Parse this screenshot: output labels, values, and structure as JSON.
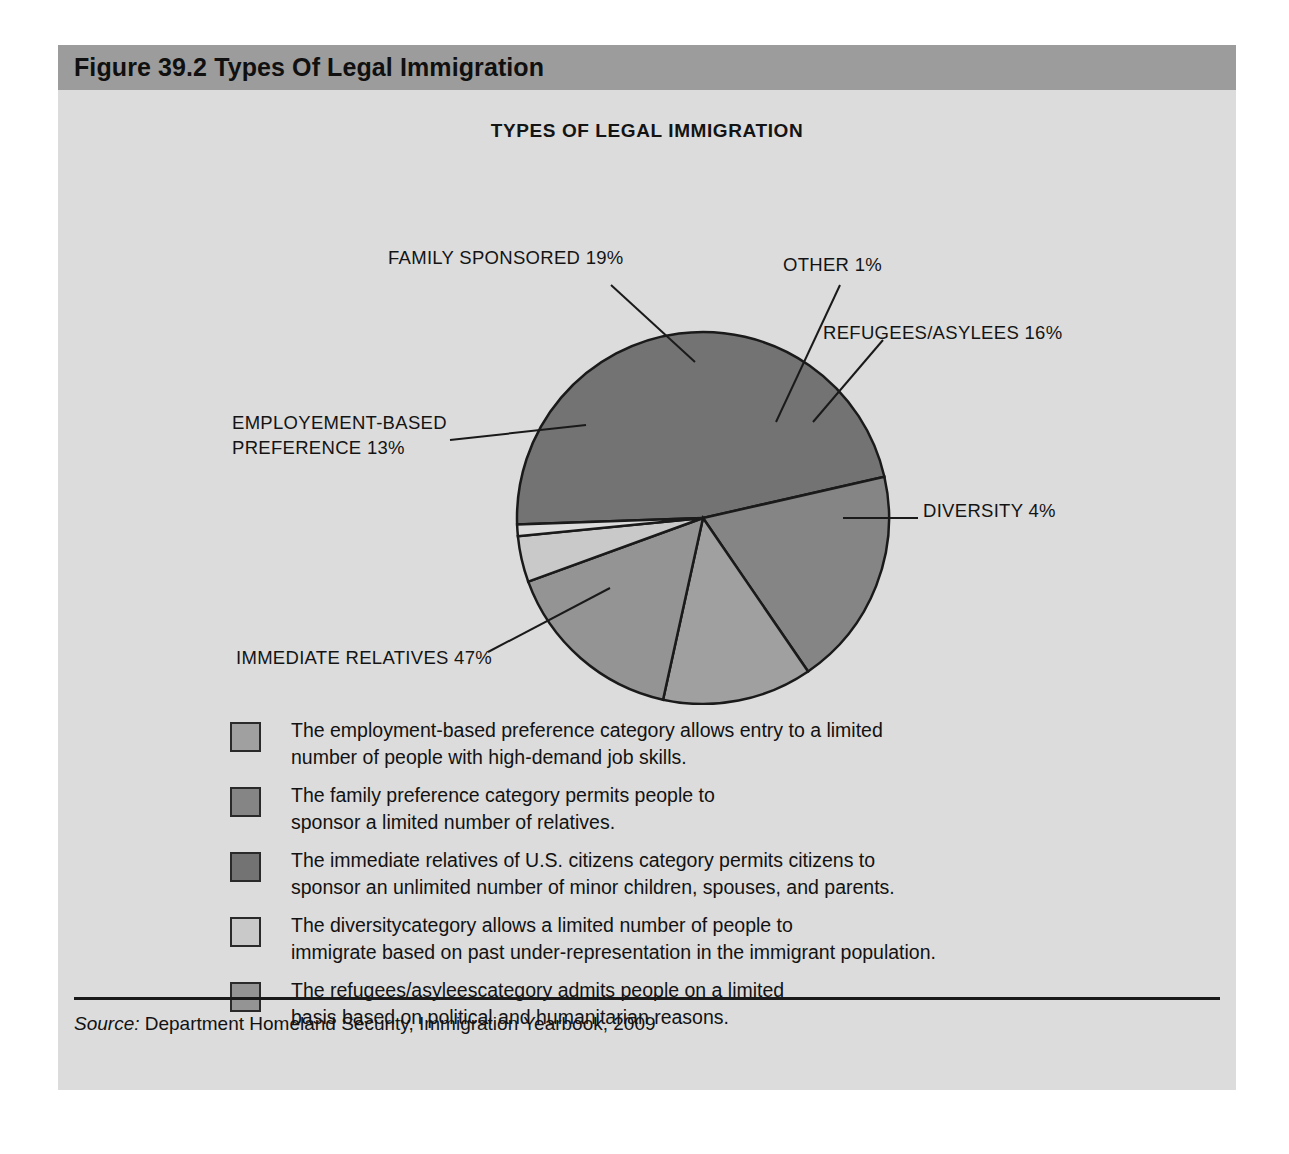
{
  "figure": {
    "header_title": "Figure 39.2  Types Of Legal Immigration",
    "chart_title": "TYPES OF LEGAL IMMIGRATION"
  },
  "source": {
    "label": "Source:",
    "text": " Department Homeland Security, Immigration Yearbook, 2009"
  },
  "colors": {
    "panel_background": "#dcdcdc",
    "header_bar": "#9c9c9c",
    "employment_based": "#a0a0a0",
    "family_sponsored": "#858585",
    "immediate_relatives": "#737373",
    "diversity": "#c9c9c9",
    "refugees_asylees": "#949494",
    "other": "#dcdcdc",
    "outline": "#1a1a1a",
    "text": "#121212"
  },
  "callouts": [
    {
      "key": "family_sponsored",
      "text": "FAMILY SPONSORED 19%"
    },
    {
      "key": "other",
      "text": "OTHER 1%"
    },
    {
      "key": "refugees_asylees",
      "text": "REFUGEES/ASYLEES 16%"
    },
    {
      "key": "employment_based",
      "line1": "EMPLOYEMENT-BASED",
      "line2": "PREFERENCE 13%"
    },
    {
      "key": "diversity",
      "text": "DIVERSITY 4%"
    },
    {
      "key": "immediate_relatives",
      "text": "IMMEDIATE RELATIVES 47%"
    }
  ],
  "legend": [
    {
      "swatch_color": "#a0a0a0",
      "text": "The employment-based preference category allows entry to a limited\nnumber of people with high-demand job skills."
    },
    {
      "swatch_color": "#858585",
      "text": "The family preference category permits people to\nsponsor a limited number of relatives."
    },
    {
      "swatch_color": "#737373",
      "text": "The immediate relatives of U.S. citizens category permits citizens to\nsponsor an unlimited number of minor children, spouses, and parents."
    },
    {
      "swatch_color": "#c9c9c9",
      "text": "The diversitycategory allows a limited number of people to\nimmigrate based on past under-representation in the immigrant population."
    },
    {
      "swatch_color": "#949494",
      "text": "The refugees/asyleescategory admits people on a limited\n basis based on political and humanitarian reasons."
    }
  ],
  "chart_data": {
    "type": "pie",
    "title": "TYPES OF LEGAL IMMIGRATION",
    "labels": [
      "IMMEDIATE RELATIVES",
      "FAMILY SPONSORED",
      "EMPLOYEMENT-BASED PREFERENCE",
      "REFUGEES/ASYLEES",
      "DIVERSITY",
      "OTHER"
    ],
    "values": [
      47,
      19,
      13,
      16,
      4,
      1
    ],
    "units": "percent",
    "total": 100,
    "colors": [
      "#737373",
      "#858585",
      "#a0a0a0",
      "#949494",
      "#c9c9c9",
      "#dcdcdc"
    ],
    "legend_position": "below",
    "grid": false,
    "source": "Department Homeland Security, Immigration Yearbook, 2009"
  }
}
